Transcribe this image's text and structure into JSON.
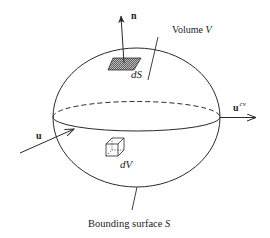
{
  "diagram": {
    "type": "control-volume",
    "labels": {
      "normal_vector": "n",
      "surface_element": "dS",
      "volume": "Volume V",
      "volume_word": "Volume ",
      "volume_symbol": "V",
      "outflow_velocity": "u",
      "outflow_superscript": "cv",
      "inflow_velocity": "u",
      "volume_element": "dV",
      "bounding_surface_word": "Bounding surface ",
      "bounding_surface_symbol": "S"
    },
    "colors": {
      "stroke": "#2a2a2a",
      "hatch": "#555555",
      "background": "#ffffff"
    }
  }
}
